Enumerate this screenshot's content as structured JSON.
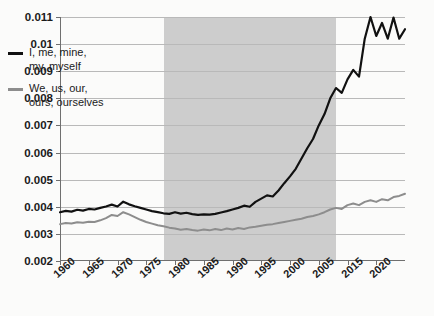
{
  "chart_data": {
    "type": "line",
    "title": "",
    "xlabel": "",
    "ylabel": "",
    "xlim": [
      1960,
      2020
    ],
    "ylim": [
      0.002,
      0.011
    ],
    "grid": true,
    "legend_position": "upper-left-inside",
    "ytick_labels": [
      "0.002",
      "0.003",
      "0.004",
      "0.005",
      "0.006",
      "0.007",
      "0.008",
      "0.009",
      "0.01",
      "0.011"
    ],
    "ytick_values": [
      0.002,
      0.003,
      0.004,
      0.005,
      0.006,
      0.007,
      0.008,
      0.009,
      0.01,
      0.011
    ],
    "xtick_labels": [
      "1960",
      "1965",
      "1970",
      "1975",
      "1980",
      "1985",
      "1990",
      "1995",
      "2000",
      "2005",
      "2015",
      "2020"
    ],
    "xtick_values": [
      1960,
      1965,
      1970,
      1975,
      1980,
      1985,
      1990,
      1995,
      2000,
      2005,
      2010,
      2015
    ],
    "shaded_region": {
      "label": "shaded-band",
      "x_start": 1978,
      "x_end": 2008,
      "color": "#c9c9c9"
    },
    "x": [
      1960,
      1961,
      1962,
      1963,
      1964,
      1965,
      1966,
      1967,
      1968,
      1969,
      1970,
      1971,
      1972,
      1973,
      1974,
      1975,
      1976,
      1977,
      1978,
      1979,
      1980,
      1981,
      1982,
      1983,
      1984,
      1985,
      1986,
      1987,
      1988,
      1989,
      1990,
      1991,
      1992,
      1993,
      1994,
      1995,
      1996,
      1997,
      1998,
      1999,
      2000,
      2001,
      2002,
      2003,
      2004,
      2005,
      2006,
      2007,
      2008,
      2009,
      2010,
      2011,
      2012,
      2013,
      2014,
      2015,
      2016,
      2017,
      2018,
      2019,
      2020
    ],
    "series": [
      {
        "name": "I, me, mine, my, myself",
        "color": "#111111",
        "values": [
          0.0038,
          0.00385,
          0.00382,
          0.00389,
          0.00386,
          0.00392,
          0.0039,
          0.00396,
          0.00401,
          0.00408,
          0.00401,
          0.00419,
          0.00409,
          0.00402,
          0.00396,
          0.0039,
          0.00384,
          0.0038,
          0.00376,
          0.00374,
          0.0038,
          0.00375,
          0.00378,
          0.00373,
          0.0037,
          0.00372,
          0.00371,
          0.00374,
          0.00379,
          0.00384,
          0.0039,
          0.00396,
          0.00404,
          0.004,
          0.00418,
          0.0043,
          0.00442,
          0.00438,
          0.0046,
          0.00487,
          0.00512,
          0.0054,
          0.00578,
          0.00616,
          0.0065,
          0.007,
          0.00742,
          0.008,
          0.00838,
          0.0082,
          0.0087,
          0.00905,
          0.0088,
          0.0102,
          0.011,
          0.0103,
          0.01078,
          0.0102,
          0.01098,
          0.0102,
          0.01055
        ],
        "style": "solid",
        "width": 2.2
      },
      {
        "name": "We, us, our, ours, ourselves",
        "color": "#8d8d8d",
        "values": [
          0.00336,
          0.0034,
          0.00338,
          0.00343,
          0.00341,
          0.00345,
          0.00344,
          0.0035,
          0.00358,
          0.0037,
          0.00366,
          0.0038,
          0.00372,
          0.00362,
          0.00352,
          0.00344,
          0.00338,
          0.00332,
          0.00328,
          0.00323,
          0.0032,
          0.00315,
          0.00318,
          0.00314,
          0.00312,
          0.00316,
          0.00313,
          0.00318,
          0.00314,
          0.0032,
          0.00316,
          0.00322,
          0.00318,
          0.00324,
          0.00326,
          0.0033,
          0.00334,
          0.00336,
          0.0034,
          0.00344,
          0.00348,
          0.00352,
          0.00356,
          0.00362,
          0.00366,
          0.00372,
          0.0038,
          0.0039,
          0.00396,
          0.00392,
          0.00406,
          0.00412,
          0.00406,
          0.00418,
          0.00424,
          0.00418,
          0.00428,
          0.00424,
          0.00436,
          0.0044,
          0.00448
        ],
        "style": "solid",
        "width": 2.0
      }
    ]
  },
  "legend": {
    "entries": [
      {
        "label": "I, me, mine,\nmy, myself",
        "color": "#111111"
      },
      {
        "label": "We, us, our,\nours, ourselves",
        "color": "#8d8d8d"
      }
    ]
  }
}
